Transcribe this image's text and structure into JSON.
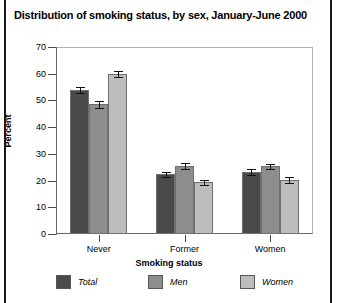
{
  "chart_data": {
    "type": "bar",
    "title": "Distribution of smoking status, by sex, January-June 2000",
    "xlabel": "Smoking status",
    "ylabel": "Percent",
    "ylim": [
      0,
      70
    ],
    "yticks": [
      0,
      10,
      20,
      30,
      40,
      50,
      60,
      70
    ],
    "grid": false,
    "legend_position": "bottom",
    "categories": [
      "Never",
      "Former",
      "Women"
    ],
    "series": [
      {
        "name": "Total",
        "color": "#4a4a4a",
        "values": [
          54.0,
          22.4,
          23.1
        ],
        "errors": [
          1.2,
          0.9,
          1.1
        ]
      },
      {
        "name": "Men",
        "color": "#8d8d8d",
        "values": [
          48.6,
          25.6,
          25.3
        ],
        "errors": [
          1.3,
          1.1,
          1.0
        ]
      },
      {
        "name": "Women",
        "color": "#bdbdbd",
        "values": [
          59.9,
          19.3,
          20.3
        ],
        "errors": [
          1.2,
          1.0,
          1.2
        ]
      }
    ]
  }
}
